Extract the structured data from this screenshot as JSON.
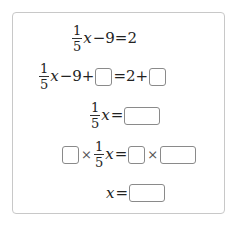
{
  "problem": {
    "steps": [
      {
        "id": "step-1",
        "fraction": {
          "numerator": "1",
          "denominator": "5"
        },
        "variable": "x",
        "rest": "−9=2"
      },
      {
        "id": "step-2",
        "fraction": {
          "numerator": "1",
          "denominator": "5"
        },
        "variable": "x",
        "left_rest": "−9+",
        "equals_part": "=2+",
        "blanks": [
          "",
          ""
        ]
      },
      {
        "id": "step-3",
        "fraction": {
          "numerator": "1",
          "denominator": "5"
        },
        "variable": "x",
        "equals": "=",
        "blanks": [
          ""
        ]
      },
      {
        "id": "step-4",
        "times": "×",
        "fraction": {
          "numerator": "1",
          "denominator": "5"
        },
        "variable": "x",
        "equals": "=",
        "blanks": [
          "",
          "",
          ""
        ]
      },
      {
        "id": "step-5",
        "variable": "x",
        "equals": "=",
        "blanks": [
          ""
        ]
      }
    ]
  },
  "colors": {
    "panel_border": "#c8c8c8",
    "blank_border": "#8a8a8a",
    "text": "#222222"
  }
}
